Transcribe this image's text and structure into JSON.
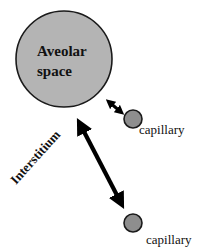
{
  "diagram": {
    "alveolus": {
      "label_line1": "Aveolar",
      "label_line2": "space",
      "fill": "#b4b4b4",
      "stroke": "#1a1a1a"
    },
    "capillary_near": {
      "label": "capillary",
      "fill": "#8e8e8e"
    },
    "capillary_far": {
      "label": "capillary",
      "fill": "#8e8e8e"
    },
    "interstitium": {
      "label": "Interstitium"
    },
    "arrows": [
      {
        "name": "short-double-arrow",
        "from": "alveolus",
        "to": "capillary_near"
      },
      {
        "name": "long-double-arrow",
        "from": "alveolus",
        "to": "capillary_far"
      }
    ],
    "colors": {
      "arrow": "#000000",
      "text": "#111111",
      "background": "#ffffff"
    }
  }
}
